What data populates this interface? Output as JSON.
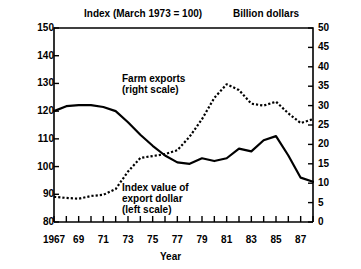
{
  "titles": {
    "left_axis_title": "Index (March 1973 = 100)",
    "right_axis_title": "Billion dollars",
    "xaxis_title": "Year"
  },
  "annotations": {
    "farm_line1": "Farm exports",
    "farm_line2": "(right scale)",
    "index_line1": "Index value of",
    "index_line2": "export dollar",
    "index_line3": "(left scale)"
  },
  "chart_data": {
    "type": "line",
    "title": "",
    "xlabel": "Year",
    "ylabel": "Index (March 1973 = 100)",
    "y2label": "Billion dollars",
    "grid": false,
    "legend_position": "inline-annotation",
    "xlim": [
      1967,
      1988
    ],
    "ylim": [
      80,
      150
    ],
    "y2lim": [
      0,
      50
    ],
    "yticks": [
      80,
      90,
      100,
      110,
      120,
      130,
      140,
      150
    ],
    "y2ticks": [
      0,
      5,
      10,
      15,
      20,
      25,
      30,
      35,
      40,
      45,
      50
    ],
    "xticks": [
      1967,
      1968,
      1969,
      1970,
      1971,
      1972,
      1973,
      1974,
      1975,
      1976,
      1977,
      1978,
      1979,
      1980,
      1981,
      1982,
      1983,
      1984,
      1985,
      1986,
      1987,
      1988
    ],
    "xtick_labels": [
      "1967",
      "",
      "69",
      "",
      "71",
      "",
      "73",
      "",
      "75",
      "",
      "77",
      "",
      "79",
      "",
      "81",
      "",
      "83",
      "",
      "85",
      "",
      "87",
      ""
    ],
    "x": [
      1967,
      1968,
      1969,
      1970,
      1971,
      1972,
      1973,
      1974,
      1975,
      1976,
      1977,
      1978,
      1979,
      1980,
      1981,
      1982,
      1983,
      1984,
      1985,
      1986,
      1987,
      1988
    ],
    "series": [
      {
        "name": "Index value of export dollar (left scale)",
        "axis": "left",
        "style": "solid",
        "color": "#000000",
        "values": [
          120.0,
          121.8,
          122.2,
          122.2,
          121.5,
          120.0,
          116.0,
          111.5,
          107.5,
          104.0,
          101.5,
          101.0,
          103.0,
          102.0,
          103.0,
          106.5,
          105.5,
          109.5,
          111.0,
          104.0,
          96.0,
          94.5
        ]
      },
      {
        "name": "Farm exports (right scale)",
        "axis": "right",
        "style": "dotted",
        "color": "#000000",
        "values": [
          6.5,
          6.2,
          6.0,
          6.7,
          7.0,
          8.5,
          13.0,
          16.5,
          17.0,
          17.5,
          18.5,
          22.0,
          26.5,
          32.0,
          35.5,
          34.0,
          30.5,
          30.0,
          31.0,
          28.0,
          25.5,
          26.5
        ]
      }
    ]
  }
}
